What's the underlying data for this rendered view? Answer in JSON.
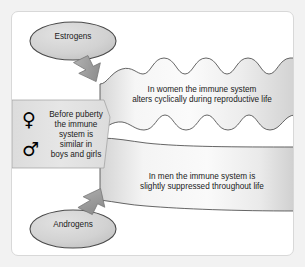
{
  "diagram": {
    "type": "concept-diagram",
    "colors": {
      "page_background": "#f2f2f2",
      "panel_background": "#ffffff",
      "frame_border": "#d8d8d8",
      "band_fill_light": "#f4f4f4",
      "band_fill_dark": "#d5d5d5",
      "ellipse_fill": "#d2d2d2",
      "ellipse_stroke": "#4a4a4a",
      "arrow_fill": "#9a9a9a",
      "arrow_stroke": "#6f6f6f",
      "wave_stroke": "#4a4a4a",
      "text": "#1a1a1a",
      "symbol": "#000000"
    },
    "nodes": {
      "estrogens": {
        "label": "Estrogens",
        "shape": "ellipse",
        "position": "top-left"
      },
      "androgens": {
        "label": "Androgens",
        "shape": "ellipse",
        "position": "bottom-left"
      },
      "prepuberty": {
        "label": "Before puberty\nthe immune\nsystem is\nsimilar in\nboys and girls",
        "shape": "panel",
        "position": "left-middle",
        "symbols": [
          "venus-symbol",
          "mars-symbol"
        ]
      },
      "women": {
        "label": "In women the immune system\nalters cyclically during reproductive life",
        "shape": "wavy-band",
        "position": "upper-right"
      },
      "men": {
        "label": "In men the immune system is\nslightly suppressed throughout life",
        "shape": "tapering-band",
        "position": "lower-right"
      }
    },
    "symbols": {
      "venus": "♀",
      "mars": "♂"
    },
    "arrows": [
      {
        "name": "estrogens-to-women-arrow",
        "from": "estrogens",
        "to": "women",
        "direction": "down-right"
      },
      {
        "name": "androgens-to-men-arrow",
        "from": "androgens",
        "to": "men",
        "direction": "up-right"
      }
    ]
  }
}
